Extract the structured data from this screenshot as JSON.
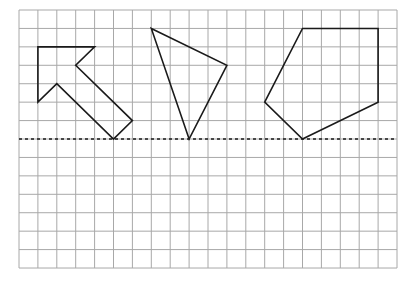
{
  "grid": {
    "origin_x": 19,
    "origin_y": 10,
    "cols": 20,
    "rows": 14,
    "cell_w": 18.9,
    "cell_h": 18.43,
    "line_color": "#a8a8a8"
  },
  "mirror_line": {
    "style": "dotted",
    "row": 7,
    "color": "#1a1a1a"
  },
  "shapes": [
    {
      "name": "arrow",
      "points": [
        [
          1,
          2
        ],
        [
          4,
          2
        ],
        [
          3,
          3
        ],
        [
          6,
          6
        ],
        [
          5,
          7
        ],
        [
          2,
          4
        ],
        [
          1,
          5
        ]
      ]
    },
    {
      "name": "triangle",
      "points": [
        [
          7,
          1
        ],
        [
          11,
          3
        ],
        [
          9,
          7
        ]
      ]
    },
    {
      "name": "pentagon",
      "points": [
        [
          15,
          1
        ],
        [
          19,
          1
        ],
        [
          19,
          5
        ],
        [
          15,
          7
        ],
        [
          13,
          5
        ]
      ]
    }
  ]
}
